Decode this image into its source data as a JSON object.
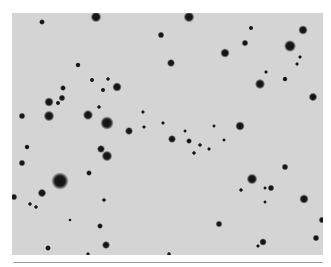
{
  "image": {
    "kind": "grayscale star field",
    "background_color": "#d4d4d4",
    "star_color": "#111111",
    "frame": {
      "x": 12,
      "y": 13,
      "width": 311,
      "height": 242
    },
    "rule_line": {
      "x": 13,
      "y": 262,
      "width": 310,
      "color": "#9a9a9a"
    }
  },
  "stars": [
    {
      "x": 42,
      "y": 22,
      "r": 2.2
    },
    {
      "x": 96,
      "y": 17,
      "r": 4
    },
    {
      "x": 189,
      "y": 17,
      "r": 4
    },
    {
      "x": 161,
      "y": 35,
      "r": 2.5
    },
    {
      "x": 303,
      "y": 30,
      "r": 3.5
    },
    {
      "x": 251,
      "y": 28,
      "r": 1.8
    },
    {
      "x": 245,
      "y": 43,
      "r": 2.5
    },
    {
      "x": 290,
      "y": 46,
      "r": 4.5
    },
    {
      "x": 225,
      "y": 53,
      "r": 3.5
    },
    {
      "x": 171,
      "y": 63,
      "r": 3
    },
    {
      "x": 300,
      "y": 57,
      "r": 1.5
    },
    {
      "x": 297,
      "y": 64,
      "r": 1.5
    },
    {
      "x": 78,
      "y": 65,
      "r": 2
    },
    {
      "x": 266,
      "y": 72,
      "r": 1.5
    },
    {
      "x": 92,
      "y": 80,
      "r": 1.8
    },
    {
      "x": 108,
      "y": 79,
      "r": 1.6
    },
    {
      "x": 117,
      "y": 87,
      "r": 3.5
    },
    {
      "x": 63,
      "y": 88,
      "r": 2.2
    },
    {
      "x": 103,
      "y": 90,
      "r": 1.8
    },
    {
      "x": 260,
      "y": 84,
      "r": 3.8
    },
    {
      "x": 285,
      "y": 79,
      "r": 2
    },
    {
      "x": 313,
      "y": 97,
      "r": 3.2
    },
    {
      "x": 49,
      "y": 102,
      "r": 3.5
    },
    {
      "x": 62,
      "y": 98,
      "r": 2.5
    },
    {
      "x": 58,
      "y": 103,
      "r": 1.8
    },
    {
      "x": 88,
      "y": 115,
      "r": 3.8
    },
    {
      "x": 107,
      "y": 123,
      "r": 5
    },
    {
      "x": 49,
      "y": 116,
      "r": 4
    },
    {
      "x": 99,
      "y": 107,
      "r": 1.6
    },
    {
      "x": 129,
      "y": 131,
      "r": 3
    },
    {
      "x": 143,
      "y": 112,
      "r": 1.5
    },
    {
      "x": 163,
      "y": 123,
      "r": 1.5
    },
    {
      "x": 144,
      "y": 127,
      "r": 1.5
    },
    {
      "x": 240,
      "y": 126,
      "r": 3.5
    },
    {
      "x": 22,
      "y": 116,
      "r": 2.5
    },
    {
      "x": 27,
      "y": 147,
      "r": 2
    },
    {
      "x": 101,
      "y": 149,
      "r": 3
    },
    {
      "x": 107,
      "y": 156,
      "r": 4
    },
    {
      "x": 22,
      "y": 163,
      "r": 2.5
    },
    {
      "x": 60,
      "y": 181,
      "r": 6.5
    },
    {
      "x": 42,
      "y": 193,
      "r": 3.2
    },
    {
      "x": 14,
      "y": 197,
      "r": 2.5
    },
    {
      "x": 30,
      "y": 204,
      "r": 1.6
    },
    {
      "x": 36,
      "y": 207,
      "r": 1.6
    },
    {
      "x": 89,
      "y": 173,
      "r": 2.2
    },
    {
      "x": 104,
      "y": 200,
      "r": 1.6
    },
    {
      "x": 100,
      "y": 226,
      "r": 2.2
    },
    {
      "x": 106,
      "y": 245,
      "r": 3
    },
    {
      "x": 48,
      "y": 248,
      "r": 2.2
    },
    {
      "x": 88,
      "y": 254,
      "r": 1.5
    },
    {
      "x": 172,
      "y": 139,
      "r": 3
    },
    {
      "x": 189,
      "y": 141,
      "r": 2.2
    },
    {
      "x": 194,
      "y": 153,
      "r": 1.6
    },
    {
      "x": 200,
      "y": 145,
      "r": 1.6
    },
    {
      "x": 209,
      "y": 149,
      "r": 1.5
    },
    {
      "x": 224,
      "y": 140,
      "r": 1.4
    },
    {
      "x": 185,
      "y": 131,
      "r": 1.4
    },
    {
      "x": 285,
      "y": 167,
      "r": 2.5
    },
    {
      "x": 252,
      "y": 179,
      "r": 4
    },
    {
      "x": 271,
      "y": 188,
      "r": 2.5
    },
    {
      "x": 241,
      "y": 190,
      "r": 1.6
    },
    {
      "x": 265,
      "y": 188,
      "r": 1.4
    },
    {
      "x": 265,
      "y": 202,
      "r": 1.4
    },
    {
      "x": 304,
      "y": 199,
      "r": 3.5
    },
    {
      "x": 219,
      "y": 224,
      "r": 2.5
    },
    {
      "x": 263,
      "y": 242,
      "r": 2.8
    },
    {
      "x": 258,
      "y": 246,
      "r": 1.5
    },
    {
      "x": 316,
      "y": 238,
      "r": 2.5
    },
    {
      "x": 322,
      "y": 220,
      "r": 2.5
    },
    {
      "x": 169,
      "y": 254,
      "r": 1.6
    },
    {
      "x": 214,
      "y": 126,
      "r": 1.4
    },
    {
      "x": 70,
      "y": 220,
      "r": 1.3
    }
  ]
}
